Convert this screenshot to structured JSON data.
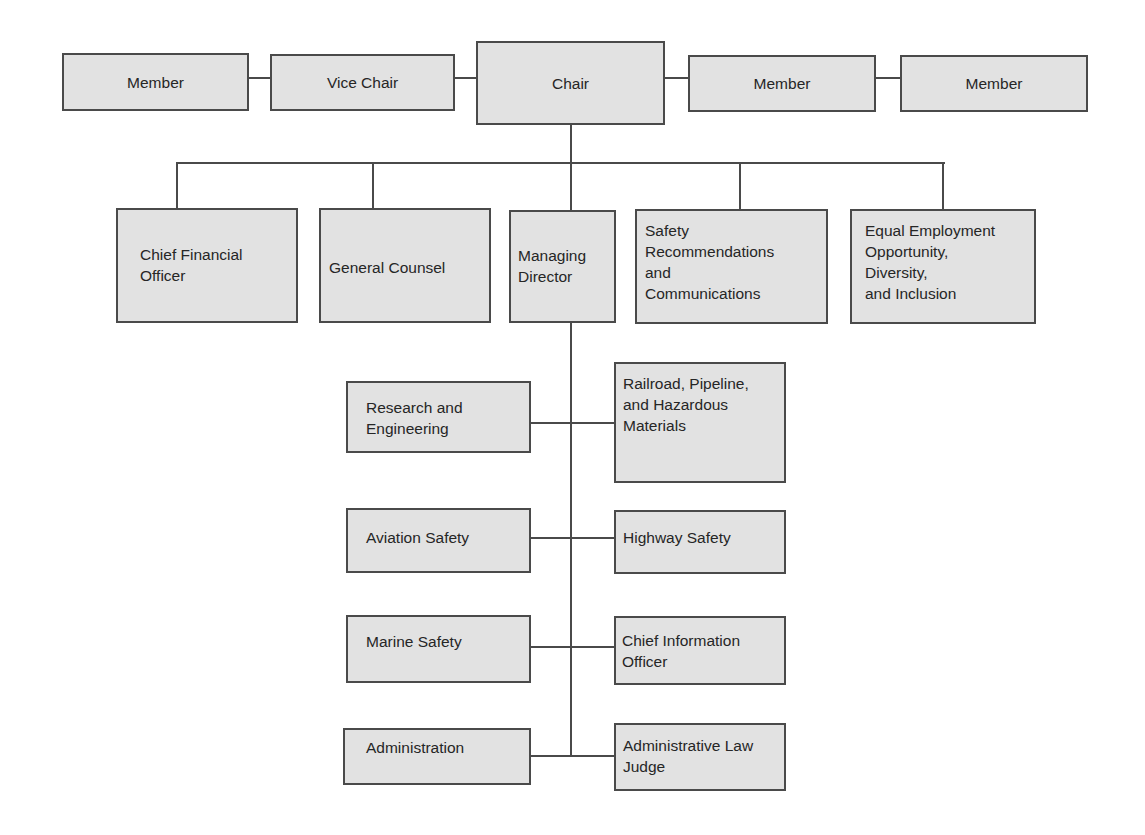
{
  "diagram": {
    "type": "org-chart",
    "colors": {
      "box_fill": "#e2e2e2",
      "box_border": "#4a4a4a",
      "line": "#4a4a4a",
      "text": "#262626",
      "background": "#ffffff"
    },
    "top_row": {
      "member_left": "Member",
      "vice_chair": "Vice Chair",
      "chair": "Chair",
      "member_right_1": "Member",
      "member_right_2": "Member"
    },
    "second_row": {
      "chief_financial_officer": "Chief Financial\nOfficer",
      "general_counsel": "General Counsel",
      "managing_director": "Managing\nDirector",
      "safety_recommendations": "Safety\nRecommendations\nand\nCommunications",
      "equal_employment": "Equal Employment\nOpportunity,\nDiversity,\nand Inclusion"
    },
    "offices_left": {
      "research_engineering": "Research and\nEngineering",
      "aviation_safety": "Aviation Safety",
      "marine_safety": "Marine Safety",
      "administration": "Administration"
    },
    "offices_right": {
      "railroad_pipeline": "Railroad, Pipeline,\nand Hazardous\nMaterials",
      "highway_safety": "Highway Safety",
      "chief_information_officer": "Chief Information\nOfficer",
      "administrative_law_judge": "Administrative Law\nJudge"
    }
  }
}
